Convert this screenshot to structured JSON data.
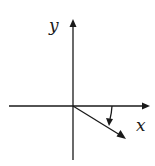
{
  "diagram": {
    "type": "coordinate-axes-with-vectors",
    "labels": {
      "x_axis": "x",
      "y_axis": "y"
    },
    "elements": [
      {
        "name": "x-axis",
        "description": "horizontal axis with arrowhead pointing right"
      },
      {
        "name": "y-axis",
        "description": "vertical axis with arrowhead pointing up"
      },
      {
        "name": "vector",
        "description": "arrow from origin pointing down-right (below x-axis)"
      },
      {
        "name": "rotation-arrow",
        "description": "short arrow from x-axis curving down toward the vector, indicating rotation clockwise"
      }
    ],
    "colors": {
      "ink": "#1a1a1a",
      "background": "#ffffff"
    }
  }
}
